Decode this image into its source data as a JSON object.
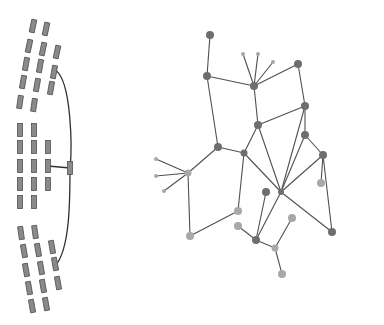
{
  "diagram": {
    "type": "network",
    "left_panel": {
      "name": "rectangle-cluster",
      "rect_size": [
        5,
        13
      ],
      "rects": [
        {
          "x": 33,
          "y": 26,
          "r": 12
        },
        {
          "x": 46,
          "y": 29,
          "r": 12
        },
        {
          "x": 29,
          "y": 46,
          "r": 12
        },
        {
          "x": 43,
          "y": 49,
          "r": 12
        },
        {
          "x": 57,
          "y": 52,
          "r": 12
        },
        {
          "x": 26,
          "y": 64,
          "r": 10
        },
        {
          "x": 40,
          "y": 66,
          "r": 10
        },
        {
          "x": 54,
          "y": 72,
          "r": 10
        },
        {
          "x": 23,
          "y": 82,
          "r": 10
        },
        {
          "x": 37,
          "y": 85,
          "r": 10
        },
        {
          "x": 51,
          "y": 88,
          "r": 10
        },
        {
          "x": 20,
          "y": 102,
          "r": 8
        },
        {
          "x": 34,
          "y": 105,
          "r": 8
        },
        {
          "x": 20,
          "y": 130,
          "r": 0
        },
        {
          "x": 34,
          "y": 130,
          "r": 0
        },
        {
          "x": 20,
          "y": 147,
          "r": 0
        },
        {
          "x": 34,
          "y": 147,
          "r": 0
        },
        {
          "x": 48,
          "y": 147,
          "r": 0
        },
        {
          "x": 20,
          "y": 166,
          "r": 0
        },
        {
          "x": 34,
          "y": 166,
          "r": 0
        },
        {
          "x": 48,
          "y": 166,
          "r": 0
        },
        {
          "x": 20,
          "y": 184,
          "r": 0
        },
        {
          "x": 34,
          "y": 184,
          "r": 0
        },
        {
          "x": 48,
          "y": 184,
          "r": 0
        },
        {
          "x": 20,
          "y": 202,
          "r": 0
        },
        {
          "x": 34,
          "y": 202,
          "r": 0
        },
        {
          "x": 70,
          "y": 168,
          "r": 0
        },
        {
          "x": 21,
          "y": 233,
          "r": -8
        },
        {
          "x": 35,
          "y": 232,
          "r": -8
        },
        {
          "x": 24,
          "y": 251,
          "r": -10
        },
        {
          "x": 38,
          "y": 250,
          "r": -10
        },
        {
          "x": 52,
          "y": 247,
          "r": -10
        },
        {
          "x": 26,
          "y": 270,
          "r": -10
        },
        {
          "x": 41,
          "y": 268,
          "r": -10
        },
        {
          "x": 55,
          "y": 264,
          "r": -10
        },
        {
          "x": 29,
          "y": 288,
          "r": -10
        },
        {
          "x": 43,
          "y": 286,
          "r": -10
        },
        {
          "x": 58,
          "y": 283,
          "r": -10
        },
        {
          "x": 32,
          "y": 306,
          "r": -10
        },
        {
          "x": 46,
          "y": 304,
          "r": -10
        }
      ],
      "curve_path": "M55,70 C72,80 72,150 70,168 C70,200 70,250 55,266",
      "straight_links": [
        {
          "x1": 48,
          "y1": 166,
          "x2": 70,
          "y2": 168
        }
      ]
    },
    "right_panel": {
      "name": "node-link-graph",
      "nodes": [
        {
          "id": "A",
          "x": 210,
          "y": 35,
          "r": 4,
          "tone": "dark"
        },
        {
          "id": "B",
          "x": 207,
          "y": 76,
          "r": 4,
          "tone": "dark"
        },
        {
          "id": "C",
          "x": 254,
          "y": 86,
          "r": 4,
          "tone": "dark"
        },
        {
          "id": "C1",
          "x": 243,
          "y": 54,
          "r": 2,
          "tone": "light"
        },
        {
          "id": "C2",
          "x": 258,
          "y": 54,
          "r": 2,
          "tone": "light"
        },
        {
          "id": "C3",
          "x": 273,
          "y": 62,
          "r": 2,
          "tone": "light"
        },
        {
          "id": "D",
          "x": 298,
          "y": 64,
          "r": 4,
          "tone": "dark"
        },
        {
          "id": "E",
          "x": 305,
          "y": 106,
          "r": 4,
          "tone": "dark"
        },
        {
          "id": "F",
          "x": 258,
          "y": 125,
          "r": 4,
          "tone": "dark"
        },
        {
          "id": "G",
          "x": 218,
          "y": 147,
          "r": 4,
          "tone": "dark"
        },
        {
          "id": "H",
          "x": 244,
          "y": 153,
          "r": 3.5,
          "tone": "dark"
        },
        {
          "id": "I",
          "x": 188,
          "y": 173,
          "r": 3.5,
          "tone": "light"
        },
        {
          "id": "I1",
          "x": 156,
          "y": 159,
          "r": 2,
          "tone": "light"
        },
        {
          "id": "I2",
          "x": 156,
          "y": 176,
          "r": 2,
          "tone": "light"
        },
        {
          "id": "I3",
          "x": 164,
          "y": 191,
          "r": 2,
          "tone": "light"
        },
        {
          "id": "L",
          "x": 305,
          "y": 135,
          "r": 4,
          "tone": "dark"
        },
        {
          "id": "M",
          "x": 323,
          "y": 155,
          "r": 4,
          "tone": "dark"
        },
        {
          "id": "O",
          "x": 321,
          "y": 183,
          "r": 4,
          "tone": "light"
        },
        {
          "id": "P",
          "x": 266,
          "y": 192,
          "r": 4,
          "tone": "dark"
        },
        {
          "id": "N",
          "x": 281,
          "y": 192,
          "r": 3,
          "tone": "dark"
        },
        {
          "id": "J",
          "x": 238,
          "y": 211,
          "r": 4,
          "tone": "light"
        },
        {
          "id": "R",
          "x": 238,
          "y": 226,
          "r": 4,
          "tone": "light"
        },
        {
          "id": "X",
          "x": 190,
          "y": 236,
          "r": 4,
          "tone": "light"
        },
        {
          "id": "U",
          "x": 292,
          "y": 218,
          "r": 4,
          "tone": "light"
        },
        {
          "id": "W",
          "x": 332,
          "y": 232,
          "r": 4,
          "tone": "dark"
        },
        {
          "id": "S",
          "x": 256,
          "y": 240,
          "r": 4,
          "tone": "dark"
        },
        {
          "id": "T",
          "x": 275,
          "y": 248,
          "r": 3.5,
          "tone": "light"
        },
        {
          "id": "V",
          "x": 282,
          "y": 274,
          "r": 4,
          "tone": "light"
        }
      ],
      "edges": [
        [
          "A",
          "B"
        ],
        [
          "B",
          "C"
        ],
        [
          "B",
          "G"
        ],
        [
          "C",
          "C1"
        ],
        [
          "C",
          "C2"
        ],
        [
          "C",
          "C3"
        ],
        [
          "C",
          "D"
        ],
        [
          "C",
          "F"
        ],
        [
          "D",
          "E"
        ],
        [
          "E",
          "F"
        ],
        [
          "E",
          "L"
        ],
        [
          "E",
          "N"
        ],
        [
          "F",
          "H"
        ],
        [
          "F",
          "N"
        ],
        [
          "G",
          "H"
        ],
        [
          "G",
          "I"
        ],
        [
          "H",
          "J"
        ],
        [
          "H",
          "N"
        ],
        [
          "I",
          "I1"
        ],
        [
          "I",
          "I2"
        ],
        [
          "I",
          "I3"
        ],
        [
          "I",
          "X"
        ],
        [
          "X",
          "J"
        ],
        [
          "L",
          "M"
        ],
        [
          "L",
          "N"
        ],
        [
          "M",
          "N"
        ],
        [
          "M",
          "O"
        ],
        [
          "M",
          "W"
        ],
        [
          "N",
          "W"
        ],
        [
          "N",
          "S"
        ],
        [
          "P",
          "S"
        ],
        [
          "R",
          "S"
        ],
        [
          "S",
          "T"
        ],
        [
          "T",
          "U"
        ],
        [
          "T",
          "V"
        ]
      ]
    },
    "colors": {
      "background": "#ffffff",
      "edge": "#505050",
      "node_dark": "#6e6e6e",
      "node_light": "#a8a8a8",
      "rect_fill": "#8a8a8a"
    }
  }
}
